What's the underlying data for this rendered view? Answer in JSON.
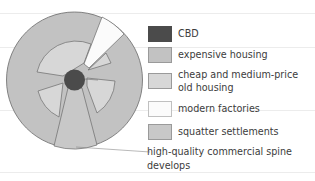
{
  "diagram": {
    "type": "urban-land-use-model",
    "colors": {
      "cbd": "#4b4b4b",
      "expensive_housing": "#c2c2c2",
      "cheap_old_housing": "#d7d7d7",
      "modern_factories": "#fbfbfb",
      "squatter_settlements": "#c8c8c8",
      "outline": "#6a6a6a"
    }
  },
  "legend": {
    "items": [
      {
        "key": "cbd",
        "label": "CBD",
        "color": "#4b4b4b"
      },
      {
        "key": "expensive_housing",
        "label": "expensive housing",
        "color": "#c2c2c2"
      },
      {
        "key": "cheap_old_housing",
        "label_line1": "cheap and medium-price",
        "label_line2": "old housing",
        "color": "#d7d7d7"
      },
      {
        "key": "modern_factories",
        "label": "modern factories",
        "color": "#fbfbfb"
      },
      {
        "key": "squatter_settlements",
        "label": "squatter settlements",
        "color": "#c8c8c8"
      }
    ]
  },
  "annotation": {
    "line1": "high-quality commercial spine",
    "line2": "develops"
  }
}
